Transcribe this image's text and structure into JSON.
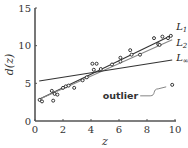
{
  "chart_data": {
    "type": "scatter",
    "title": "",
    "xlabel": "z",
    "ylabel": "d(z)",
    "xlim": [
      0,
      10
    ],
    "ylim": [
      0,
      15
    ],
    "xticks": [
      0,
      2,
      4,
      6,
      8,
      10
    ],
    "yticks": [
      0,
      5,
      10,
      15
    ],
    "xtick_labels": [
      "0",
      "2",
      "4",
      "6",
      "8",
      "10"
    ],
    "ytick_labels": [
      "0",
      "5",
      "10",
      "15"
    ],
    "grid": false,
    "points": [
      {
        "x": 0.33,
        "y": 2.8
      },
      {
        "x": 0.5,
        "y": 2.6
      },
      {
        "x": 1.2,
        "y": 4.0
      },
      {
        "x": 1.3,
        "y": 2.7
      },
      {
        "x": 1.4,
        "y": 3.6
      },
      {
        "x": 1.6,
        "y": 3.5
      },
      {
        "x": 2.0,
        "y": 4.4
      },
      {
        "x": 2.2,
        "y": 4.6
      },
      {
        "x": 2.4,
        "y": 4.7
      },
      {
        "x": 2.8,
        "y": 4.4
      },
      {
        "x": 3.4,
        "y": 5.4
      },
      {
        "x": 3.7,
        "y": 5.8
      },
      {
        "x": 4.1,
        "y": 7.6
      },
      {
        "x": 4.2,
        "y": 6.8
      },
      {
        "x": 4.4,
        "y": 7.6
      },
      {
        "x": 4.7,
        "y": 6.9
      },
      {
        "x": 5.5,
        "y": 7.5
      },
      {
        "x": 6.1,
        "y": 8.4
      },
      {
        "x": 6.1,
        "y": 7.9
      },
      {
        "x": 6.8,
        "y": 9.4
      },
      {
        "x": 6.9,
        "y": 8.8
      },
      {
        "x": 7.5,
        "y": 8.8
      },
      {
        "x": 8.5,
        "y": 11.0
      },
      {
        "x": 8.8,
        "y": 10.2
      },
      {
        "x": 8.9,
        "y": 10.1
      },
      {
        "x": 9.1,
        "y": 11.2
      },
      {
        "x": 9.5,
        "y": 11.0
      },
      {
        "x": 9.7,
        "y": 11.3
      }
    ],
    "outlier": {
      "x": 9.8,
      "y": 4.8
    },
    "series": [
      {
        "name": "L1",
        "label_main": "L",
        "label_sub": "1",
        "x": [
          0.3,
          9.8
        ],
        "y": [
          2.9,
          11.4
        ],
        "color": "#333333"
      },
      {
        "name": "L2",
        "label_main": "L",
        "label_sub": "2",
        "x": [
          0.3,
          9.8
        ],
        "y": [
          2.9,
          10.8
        ],
        "color": "#888888"
      },
      {
        "name": "L∞",
        "label_main": "L",
        "label_sub": "∞",
        "x": [
          0.3,
          9.8
        ],
        "y": [
          5.3,
          8.1
        ],
        "color": "#333333"
      }
    ],
    "annotations": [
      {
        "text": "outlier",
        "target": "outlier-point"
      }
    ]
  }
}
